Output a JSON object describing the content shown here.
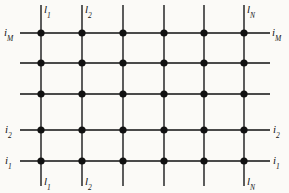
{
  "figure": {
    "type": "grid-network-diagram",
    "background_color": "#fbfaf7",
    "line_color": "#4a4a4a",
    "node_color": "#111111",
    "width": 289,
    "height": 193,
    "node_radius": 3.6,
    "line_width": 1.8
  },
  "grid": {
    "column_count": 6,
    "row_count": 5,
    "column_x": [
      41,
      82,
      123,
      164,
      204,
      244
    ],
    "row_y": [
      33,
      63,
      94,
      130,
      161
    ],
    "vertical_line_top": 5,
    "vertical_line_bottom": 186,
    "horizontal_line_left": 20,
    "horizontal_line_right": 270,
    "node_count": 30
  },
  "labels": {
    "columns_top": [
      {
        "index": 0,
        "base": "l",
        "sub": "1",
        "x": 44,
        "y": 4
      },
      {
        "index": 1,
        "base": "l",
        "sub": "2",
        "x": 85,
        "y": 4
      },
      {
        "index": 5,
        "base": "l",
        "sub": "N",
        "x": 247,
        "y": 4
      }
    ],
    "columns_bottom": [
      {
        "index": 0,
        "base": "l",
        "sub": "1",
        "x": 44,
        "y": 176
      },
      {
        "index": 1,
        "base": "l",
        "sub": "2",
        "x": 85,
        "y": 176
      },
      {
        "index": 5,
        "base": "l",
        "sub": "N",
        "x": 247,
        "y": 176
      }
    ],
    "rows_left": [
      {
        "index": 0,
        "base": "i",
        "sub": "M",
        "x": 4,
        "y": 27
      },
      {
        "index": 3,
        "base": "i",
        "sub": "2",
        "x": 5,
        "y": 124
      },
      {
        "index": 4,
        "base": "i",
        "sub": "1",
        "x": 5,
        "y": 155
      }
    ],
    "rows_right": [
      {
        "index": 0,
        "base": "i",
        "sub": "M",
        "x": 272,
        "y": 27
      },
      {
        "index": 3,
        "base": "i",
        "sub": "2",
        "x": 273,
        "y": 124
      },
      {
        "index": 4,
        "base": "i",
        "sub": "1",
        "x": 273,
        "y": 155
      }
    ]
  }
}
